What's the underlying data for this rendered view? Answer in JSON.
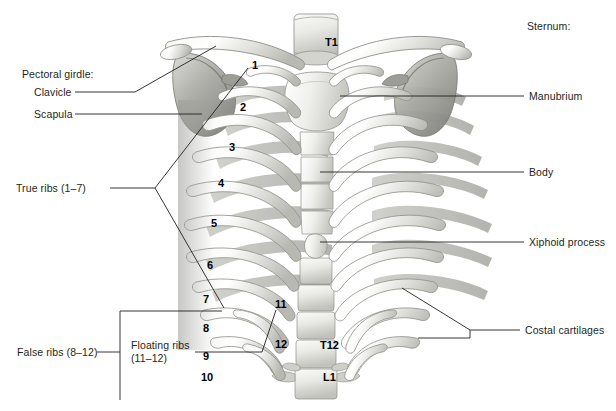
{
  "figure": {
    "background_color": "#ffffff",
    "line_color": "#231f20",
    "text_color": "#231f20",
    "width": 616,
    "height": 411
  },
  "labels": {
    "pectoral_girdle_header": "Pectoral girdle:",
    "clavicle": "Clavicle",
    "scapula": "Scapula",
    "true_ribs": "True ribs (1–7)",
    "false_ribs": "False ribs (8–12)",
    "floating_ribs": "Floating ribs (11–12)",
    "sternum_header": "Sternum:",
    "manubrium": "Manubrium",
    "body": "Body",
    "xiphoid_process": "Xiphoid process",
    "costal_cartilages": "Costal cartilages"
  },
  "rib_numbers": [
    "1",
    "2",
    "3",
    "4",
    "5",
    "6",
    "7",
    "8",
    "9",
    "10",
    "11",
    "12"
  ],
  "vertebrae": {
    "t1": "T1",
    "t12": "T12",
    "l1": "L1"
  },
  "icons": {
    "bone_illustration": "ribcage-illustration",
    "leader_line": "leader-line-icon",
    "bracket": "bracket-icon"
  }
}
